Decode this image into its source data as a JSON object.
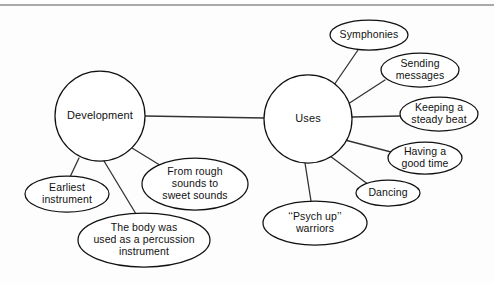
{
  "diagram": {
    "top_rule": true,
    "main_nodes": [
      {
        "id": "development",
        "label": "Development",
        "cx": 100,
        "cy": 116,
        "r": 45
      },
      {
        "id": "uses",
        "label": "Uses",
        "cx": 308,
        "cy": 119,
        "r": 44
      }
    ],
    "branch_nodes": [
      {
        "id": "earliest-instrument",
        "parent": "development",
        "lines": [
          "Earliest",
          "instrument"
        ],
        "cx": 67,
        "cy": 194,
        "rx": 42,
        "ry": 18
      },
      {
        "id": "body-percussion",
        "parent": "development",
        "lines": [
          "The body was",
          "used as a percussion",
          "instrument"
        ],
        "cx": 144,
        "cy": 240,
        "rx": 66,
        "ry": 27
      },
      {
        "id": "rough-to-sweet",
        "parent": "development",
        "lines": [
          "From rough",
          "sounds to",
          "sweet sounds"
        ],
        "cx": 195,
        "cy": 184,
        "rx": 53,
        "ry": 26
      },
      {
        "id": "symphonies",
        "parent": "uses",
        "lines": [
          "Symphonies"
        ],
        "cx": 369,
        "cy": 35,
        "rx": 39,
        "ry": 15
      },
      {
        "id": "sending-messages",
        "parent": "uses",
        "lines": [
          "Sending",
          "messages"
        ],
        "cx": 420,
        "cy": 70,
        "rx": 39,
        "ry": 17
      },
      {
        "id": "keeping-steady-beat",
        "parent": "uses",
        "lines": [
          "Keeping a",
          "steady beat"
        ],
        "cx": 439,
        "cy": 114,
        "rx": 39,
        "ry": 17
      },
      {
        "id": "having-good-time",
        "parent": "uses",
        "lines": [
          "Having a",
          "good time"
        ],
        "cx": 425,
        "cy": 158,
        "rx": 37,
        "ry": 16
      },
      {
        "id": "dancing",
        "parent": "uses",
        "lines": [
          "Dancing"
        ],
        "cx": 388,
        "cy": 193,
        "rx": 32,
        "ry": 13
      },
      {
        "id": "psych-up-warriors",
        "parent": "uses",
        "lines": [
          "‘‘Psych up’’",
          "warriors"
        ],
        "cx": 315,
        "cy": 223,
        "rx": 52,
        "ry": 22
      }
    ],
    "connectors": [
      {
        "id": "trunk-development-uses",
        "x1": 145,
        "y1": 116,
        "x2": 264,
        "y2": 118,
        "trunk": true
      },
      {
        "id": "development-earliest",
        "x1": 79,
        "y1": 158,
        "x2": 70,
        "y2": 177
      },
      {
        "id": "development-body",
        "x1": 104,
        "y1": 161,
        "x2": 136,
        "y2": 214
      },
      {
        "id": "development-rough",
        "x1": 132,
        "y1": 148,
        "x2": 163,
        "y2": 167
      },
      {
        "id": "uses-symphonies",
        "x1": 334,
        "y1": 85,
        "x2": 358,
        "y2": 50
      },
      {
        "id": "uses-sending",
        "x1": 348,
        "y1": 104,
        "x2": 385,
        "y2": 80
      },
      {
        "id": "uses-keeping",
        "x1": 352,
        "y1": 117,
        "x2": 400,
        "y2": 116
      },
      {
        "id": "uses-having",
        "x1": 345,
        "y1": 140,
        "x2": 391,
        "y2": 152
      },
      {
        "id": "uses-dancing",
        "x1": 330,
        "y1": 156,
        "x2": 369,
        "y2": 185
      },
      {
        "id": "uses-psych",
        "x1": 305,
        "y1": 163,
        "x2": 311,
        "y2": 201
      }
    ],
    "colors": {
      "stroke": "#111111",
      "connector": "#333333",
      "background": "#fdfdfd",
      "rule": "#8d8d8d"
    }
  }
}
